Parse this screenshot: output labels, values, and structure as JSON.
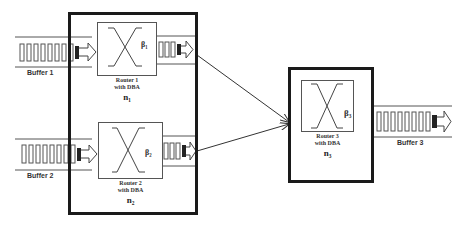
{
  "diagram": {
    "buffers": [
      {
        "id": "buffer1",
        "label": "Buffer 1"
      },
      {
        "id": "buffer2",
        "label": "Buffer 2"
      },
      {
        "id": "buffer3",
        "label": "Buffer 3"
      }
    ],
    "routers": [
      {
        "id": "router1",
        "label_line1": "Router 1",
        "label_line2": "with DBA",
        "node": "n₁",
        "beta": "β₁"
      },
      {
        "id": "router2",
        "label_line1": "Router 2",
        "label_line2": "with DBA",
        "node": "n₂",
        "beta": "β₂"
      },
      {
        "id": "router3",
        "label_line1": "Router 3",
        "label_line2": "with DBA",
        "node": "n₃",
        "beta": "β₃"
      }
    ],
    "edges": [
      {
        "from": "router1",
        "to": "router3"
      },
      {
        "from": "router2",
        "to": "router3"
      }
    ],
    "colors": {
      "line": "#1a1a1a",
      "router_border": "#555555",
      "background": "#ffffff"
    }
  }
}
